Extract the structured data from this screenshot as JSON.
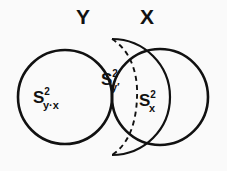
{
  "figure": {
    "type": "venn-diagram",
    "width": 227,
    "height": 171,
    "background_color": "#fafafa",
    "stroke_color": "#111111"
  },
  "sets": {
    "left": {
      "name": "left-set",
      "label": "Y",
      "center_x": 65,
      "center_y": 97,
      "radius": 47,
      "stroke_style": "solid",
      "doubled_overlap_edge": true
    },
    "right": {
      "name": "right-set",
      "label": "X",
      "center_x": 160,
      "center_y": 97,
      "radius": 48,
      "stroke_style": "solid"
    }
  },
  "dashed_arc": {
    "name": "dashed-arc",
    "description": "dashed arc from top crossing to bottom crossing bulging right",
    "start_x": 112,
    "start_y": 39,
    "end_x": 112,
    "end_y": 155,
    "bulge_x": 137,
    "stroke_style": "dashed",
    "dash_pattern": "5 4"
  },
  "regions": [
    {
      "name": "left-lobe",
      "base": "S",
      "superscript": "2",
      "subscript": "y·x",
      "full_text": "S²y·x"
    },
    {
      "name": "overlap-upper",
      "base": "S",
      "superscript": "2",
      "subscript": "y′",
      "full_text": "S²y′"
    },
    {
      "name": "right-of-dashed-arc",
      "base": "S",
      "superscript": "2",
      "subscript": "x",
      "full_text": "S²x"
    }
  ]
}
